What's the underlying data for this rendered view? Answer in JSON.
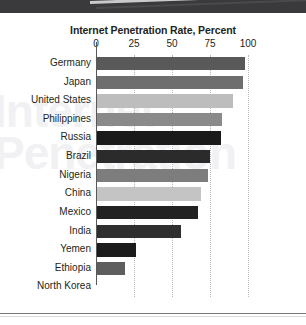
{
  "banner": {
    "stripe_icon": "diagonal-stripe"
  },
  "watermark": {
    "line1": "Internet",
    "line2": "Penetration"
  },
  "chart_data": {
    "type": "bar",
    "orientation": "horizontal",
    "title": "Internet Penetration Rate, Percent",
    "xlabel": "",
    "ylabel": "",
    "xlim": [
      0,
      100
    ],
    "xticks": [
      0,
      25,
      50,
      75,
      100
    ],
    "xtick_labels": [
      "0",
      "25",
      "50",
      "75",
      "100"
    ],
    "grid": true,
    "grid_style": "dotted-vertical",
    "legend": "none",
    "categories": [
      "Germany",
      "Japan",
      "United States",
      "Philippines",
      "Russia",
      "Brazil",
      "Nigeria",
      "China",
      "Mexico",
      "India",
      "Yemen",
      "Ethiopia",
      "North Korea"
    ],
    "values": [
      98,
      97,
      90,
      83,
      82,
      75,
      74,
      69,
      67,
      56,
      26,
      19,
      0
    ],
    "bar_colors": [
      "#595959",
      "#6e6e6e",
      "#bdbdbd",
      "#8a8a8a",
      "#1a1a1a",
      "#2b2b2b",
      "#7d7d7d",
      "#c4c4c4",
      "#222222",
      "#2f2f2f",
      "#1c1c1c",
      "#5e5e5e",
      "#ffffff"
    ]
  },
  "colors": {
    "banner": "#3a3a3c",
    "axis": "#58595b",
    "gridline": "#b9b9bb",
    "text": "#231f20",
    "background": "#ffffff"
  }
}
